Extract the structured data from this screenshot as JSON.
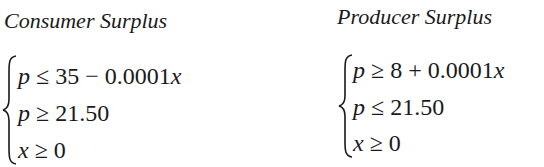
{
  "consumer": {
    "title": "Consumer Surplus",
    "lines": [
      {
        "var": "p",
        "op": "≤",
        "rhs": "35 − 0.0001",
        "rhs_var": "x"
      },
      {
        "var": "p",
        "op": "≥",
        "rhs": "21.50",
        "rhs_var": ""
      },
      {
        "var": "x",
        "op": "≥",
        "rhs": "0",
        "rhs_var": ""
      }
    ]
  },
  "producer": {
    "title": "Producer Surplus",
    "lines": [
      {
        "var": "p",
        "op": "≥",
        "rhs": "8 + 0.0001",
        "rhs_var": "x"
      },
      {
        "var": "p",
        "op": "≤",
        "rhs": "21.50",
        "rhs_var": ""
      },
      {
        "var": "x",
        "op": "≥",
        "rhs": "0",
        "rhs_var": ""
      }
    ]
  }
}
